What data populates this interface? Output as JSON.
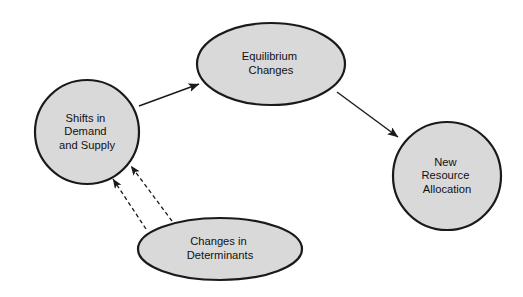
{
  "diagram": {
    "background_color": "#ffffff",
    "node_fill": "#d9d9d9",
    "node_stroke": "#1a1a1a",
    "text_color": "#111111",
    "nodes": [
      {
        "id": "shifts",
        "shape": "circle",
        "lines": [
          "Shifts in",
          "Demand",
          "and Supply"
        ],
        "cx": 87,
        "cy": 132,
        "rx": 52,
        "ry": 52
      },
      {
        "id": "equilibrium",
        "shape": "ellipse",
        "lines": [
          "Equilibrium",
          "Changes"
        ],
        "cx": 271,
        "cy": 64,
        "rx": 74,
        "ry": 41
      },
      {
        "id": "new-resource",
        "shape": "circle",
        "lines": [
          "New",
          "Resource",
          "Allocation"
        ],
        "cx": 447,
        "cy": 176,
        "rx": 54,
        "ry": 54
      },
      {
        "id": "determinants",
        "shape": "ellipse",
        "lines": [
          "Changes in",
          "Determinants"
        ],
        "cx": 220,
        "cy": 249,
        "rx": 82,
        "ry": 31
      }
    ],
    "edges": [
      {
        "id": "shifts-to-equilibrium",
        "style": "solid",
        "from": "shifts",
        "to": "equilibrium",
        "x1": 139,
        "y1": 106,
        "x2": 199,
        "y2": 84
      },
      {
        "id": "equilibrium-to-new-resource",
        "style": "solid",
        "from": "equilibrium",
        "to": "new-resource",
        "x1": 337,
        "y1": 92,
        "x2": 398,
        "y2": 137
      },
      {
        "id": "determinants-to-shifts-left",
        "style": "dashed",
        "from": "determinants",
        "to": "shifts",
        "x1": 146,
        "y1": 229,
        "x2": 113,
        "y2": 179
      },
      {
        "id": "determinants-to-shifts-right",
        "style": "dashed",
        "from": "determinants",
        "to": "shifts",
        "x1": 172,
        "y1": 221,
        "x2": 131,
        "y2": 166
      }
    ]
  }
}
